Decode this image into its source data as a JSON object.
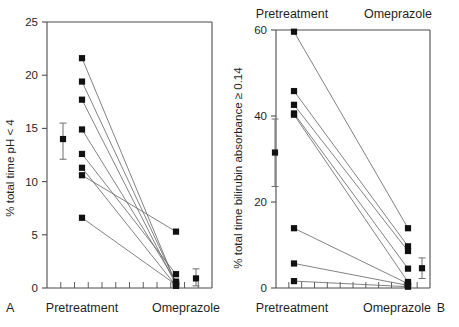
{
  "figure": {
    "background": "#ffffff",
    "marker_color": "#111111",
    "line_color": "#6b6b6b",
    "axis_color": "#4d4d4d"
  },
  "panels": [
    {
      "letter": "A",
      "ylabel": "% total time pH < 4",
      "xlabels": [
        "Pretreatment",
        "Omeprazole"
      ],
      "top_labels": [],
      "chart_data": {
        "type": "line",
        "subtype": "paired-before-after-scatter",
        "title": "",
        "xlabel": "",
        "ylabel": "% total time pH < 4",
        "categories": [
          "Pretreatment",
          "Omeprazole"
        ],
        "ylim": [
          0,
          25
        ],
        "yticks": [
          0,
          5,
          10,
          15,
          20,
          25
        ],
        "ytick_labels": [
          "0",
          "5",
          "10",
          "15",
          "20",
          "25"
        ],
        "grid": false,
        "legend": "none",
        "x_minor_tick_count": 11,
        "series": [
          {
            "name": "subject-1",
            "values": [
              21.6,
              0.4
            ]
          },
          {
            "name": "subject-2",
            "values": [
              19.4,
              0.5
            ]
          },
          {
            "name": "subject-3",
            "values": [
              17.7,
              0.3
            ]
          },
          {
            "name": "subject-4",
            "values": [
              14.9,
              0.6
            ]
          },
          {
            "name": "subject-5",
            "values": [
              12.6,
              1.3
            ]
          },
          {
            "name": "subject-6",
            "values": [
              11.3,
              0.2
            ]
          },
          {
            "name": "subject-7",
            "values": [
              10.6,
              5.3
            ]
          },
          {
            "name": "subject-8",
            "values": [
              6.6,
              0.3
            ]
          }
        ],
        "mean_markers": [
          {
            "category": "Pretreatment",
            "mean": 14.0,
            "err_low": 12.1,
            "err_high": 15.5
          },
          {
            "category": "Omeprazole",
            "mean": 0.9,
            "err_low": 0.2,
            "err_high": 1.8
          }
        ]
      }
    },
    {
      "letter": "B",
      "ylabel": "% total time bilirubin absorbance ≥ 0.14",
      "xlabels": [
        "Pretreatment",
        "Omeprazole"
      ],
      "top_labels": [
        "Pretreatment",
        "Omeprazole"
      ],
      "chart_data": {
        "type": "line",
        "subtype": "paired-before-after-scatter",
        "title": "",
        "xlabel": "",
        "ylabel": "% total time bilirubin absorbance ≥ 0.14",
        "categories": [
          "Pretreatment",
          "Omeprazole"
        ],
        "ylim": [
          0,
          60
        ],
        "yticks": [
          0,
          20,
          40,
          60
        ],
        "ytick_labels": [
          "0",
          "20",
          "40",
          "60"
        ],
        "grid": false,
        "legend": "none",
        "x_minor_tick_count": 11,
        "series": [
          {
            "name": "subject-1",
            "values": [
              59.6,
              13.9
            ]
          },
          {
            "name": "subject-2",
            "values": [
              45.8,
              9.7
            ]
          },
          {
            "name": "subject-3",
            "values": [
              42.6,
              8.6
            ]
          },
          {
            "name": "subject-4",
            "values": [
              40.6,
              4.5
            ]
          },
          {
            "name": "subject-5",
            "values": [
              40.3,
              1.4
            ]
          },
          {
            "name": "subject-6",
            "values": [
              13.9,
              1.0
            ]
          },
          {
            "name": "subject-7",
            "values": [
              5.7,
              0.6
            ]
          },
          {
            "name": "subject-8",
            "values": [
              1.6,
              0.3
            ]
          }
        ],
        "mean_markers": [
          {
            "category": "Pretreatment",
            "mean": 31.5,
            "err_low": 23.6,
            "err_high": 39.3
          },
          {
            "category": "Omeprazole",
            "mean": 4.6,
            "err_low": 2.2,
            "err_high": 7.0
          }
        ]
      }
    }
  ]
}
